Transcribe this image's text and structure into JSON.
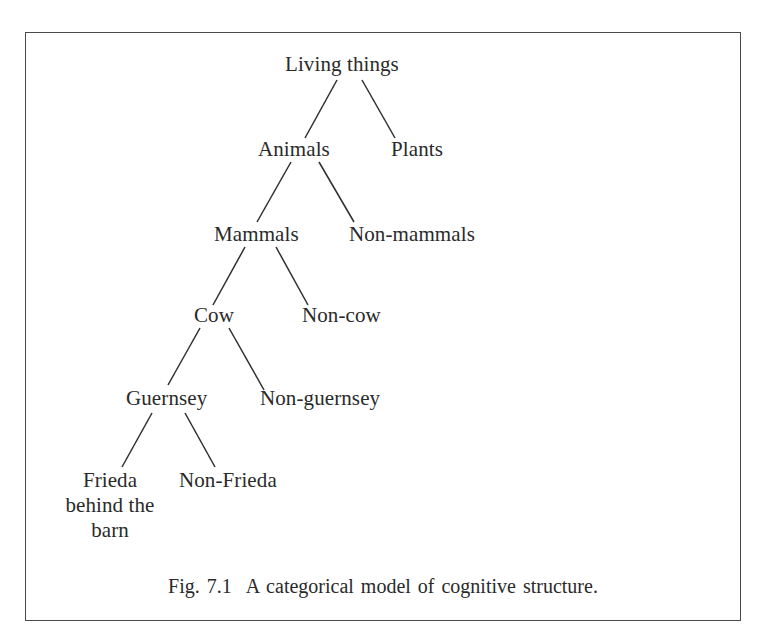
{
  "page": {
    "top_partial_text": "...p ... gu ... ( ... g ... )"
  },
  "figure": {
    "caption_number": "Fig. 7.1",
    "caption_text": "A categorical model of cognitive structure.",
    "tree": {
      "root": {
        "label": "Living things",
        "children": [
          {
            "label": "Animals",
            "children": [
              {
                "label": "Mammals",
                "children": [
                  {
                    "label": "Cow",
                    "children": [
                      {
                        "label": "Guernsey",
                        "children": [
                          {
                            "label": "Frieda behind the barn",
                            "lines": [
                              "Frieda",
                              "behind the",
                              "barn"
                            ]
                          },
                          {
                            "label": "Non-Frieda"
                          }
                        ]
                      },
                      {
                        "label": "Non-guernsey"
                      }
                    ]
                  },
                  {
                    "label": "Non-cow"
                  }
                ]
              },
              {
                "label": "Non-mammals"
              }
            ]
          },
          {
            "label": "Plants"
          }
        ]
      }
    },
    "nodes": {
      "living_things": "Living things",
      "animals": "Animals",
      "plants": "Plants",
      "mammals": "Mammals",
      "non_mammals": "Non-mammals",
      "cow": "Cow",
      "non_cow": "Non-cow",
      "guernsey": "Guernsey",
      "non_guernsey": "Non-guernsey",
      "frieda_line1": "Frieda",
      "frieda_line2": "behind the",
      "frieda_line3": "barn",
      "non_frieda": "Non-Frieda"
    }
  }
}
